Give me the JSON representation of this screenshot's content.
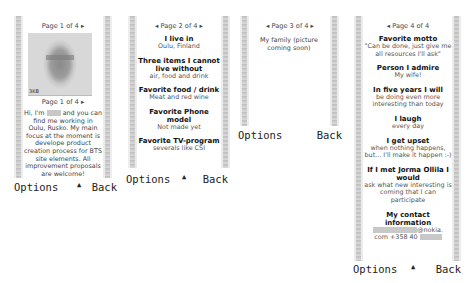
{
  "softkeys": {
    "left": "Options",
    "middle": "▲",
    "right": "Back"
  },
  "panels": [
    {
      "page_header": "Page 1 of 4 ▸",
      "photo_label": "3KB",
      "page_header_2": "Page 1 of 4 ▸",
      "intro_before": "Hi, I'm",
      "intro_after": "and you can find me working in Oulu, Rusko. My main focus at the moment is develope product creation process for BTS site elements. All improvement proposals are welcome!"
    },
    {
      "page_header": "◂ Page 2 of 4 ▸",
      "items": [
        {
          "title": "I live in",
          "value": "Oulu, Finland"
        },
        {
          "title": "Three items I cannot live without",
          "value": "air, food and drink"
        },
        {
          "title": "Favorite food / drink",
          "value": "Meat and red wine"
        },
        {
          "title": "Favorite Phone model",
          "value": "Not made yet"
        },
        {
          "title": "Favorite TV-program",
          "value": "severals like CSI"
        }
      ]
    },
    {
      "page_header": "◂ Page 3 of 4 ▸",
      "text": "My family (picture coming soon)"
    },
    {
      "page_header": "◂ Page 4 of 4",
      "items": [
        {
          "title": "Favorite motto",
          "value": "\"Can be done, just give me all resources I'll ask\""
        },
        {
          "title": "Person I admire",
          "value": "My wife!"
        },
        {
          "title": "In five years I will",
          "value": "be doing even more interesting than today"
        },
        {
          "title": "I laugh",
          "value": "every day"
        },
        {
          "title": "I get upset",
          "value": "when nothing happens, but... I'll make it happen :-)"
        },
        {
          "title": "If I met Jorma Ollila I would",
          "value": "ask what new interesting is coming that I can participate"
        },
        {
          "title": "My contact information",
          "email_suffix": "@nokia.",
          "email_tld": "com",
          "phone_prefix": "+358 40"
        }
      ]
    }
  ]
}
